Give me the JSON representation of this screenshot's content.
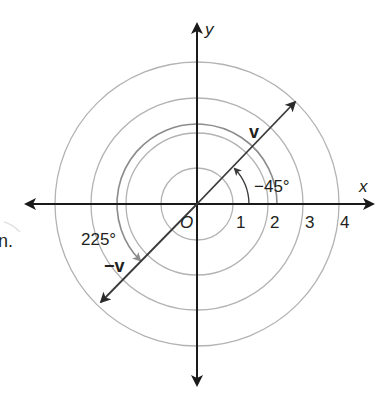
{
  "diagram": {
    "type": "polar-vector-diagram",
    "axes": {
      "x_label": "x",
      "y_label": "y",
      "origin_label": "O",
      "tick_labels": [
        "1",
        "2",
        "3",
        "4"
      ]
    },
    "circles": {
      "radii_units": [
        1,
        2,
        3,
        4
      ],
      "color": "#b3b3b3"
    },
    "vectors": [
      {
        "id": "v",
        "label": "v",
        "magnitude": 4,
        "direction_deg": 45,
        "color": "#3a3a3a"
      },
      {
        "id": "neg-v",
        "label": "−v",
        "magnitude": 4,
        "direction_deg": 225,
        "color": "#3a3a3a"
      }
    ],
    "angles": [
      {
        "id": "angle-neg45",
        "label": "−45°",
        "color": "#3a3a3a"
      },
      {
        "id": "angle-225",
        "label": "225°",
        "color": "#8c8c8c"
      }
    ],
    "margin_fragment": "n."
  },
  "colors": {
    "axis": "#1a1a1a",
    "circle": "#b3b3b3",
    "arc_225": "#8c8c8c",
    "vector": "#3a3a3a",
    "text": "#231f20"
  }
}
